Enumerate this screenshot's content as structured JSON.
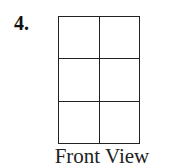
{
  "problem": {
    "number": "4.",
    "view_label": "Front View"
  },
  "diagram": {
    "type": "grid",
    "rows": 3,
    "columns": 2,
    "line_color": "#222222"
  }
}
